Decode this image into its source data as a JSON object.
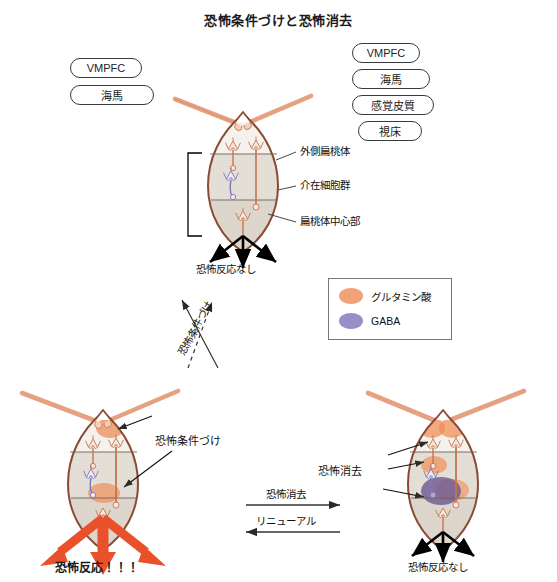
{
  "title": "恐怖条件づけと恐怖消去",
  "inputs": {
    "left_group": [
      {
        "label": "VMPFC"
      },
      {
        "label": "海馬"
      }
    ],
    "right_group": [
      {
        "label": "VMPFC"
      },
      {
        "label": "海馬"
      },
      {
        "label": "感覚皮質"
      },
      {
        "label": "視床"
      }
    ]
  },
  "panels": {
    "top": {
      "name": "naive-amygdala",
      "region_labels": [
        {
          "label": "外側扁桃体"
        },
        {
          "label": "介在細胞群"
        },
        {
          "label": "扁桃体中心部"
        }
      ],
      "output_caption": "恐怖反応なし"
    },
    "bottom_left": {
      "name": "conditioned-amygdala",
      "annotation": "恐怖条件づけ",
      "output_caption": "恐怖反応！！！"
    },
    "bottom_right": {
      "name": "extinguished-amygdala",
      "annotation": "恐怖消去",
      "output_caption": "恐怖反応なし"
    }
  },
  "transitions": {
    "vertical": {
      "forward_label": "恐怖条件づけ"
    },
    "horizontal": {
      "forward_label": "恐怖消去",
      "backward_label": "リニューアル"
    }
  },
  "legend": {
    "items": [
      {
        "label": "グルタミン酸",
        "color": "#f2a278",
        "shape": "ellipse"
      },
      {
        "label": "GABA",
        "color": "#9b8ec8",
        "shape": "ellipse"
      }
    ]
  },
  "colors": {
    "outline": "#8a4a33",
    "axon": "#e5a181",
    "glutamate": "#f2a278",
    "gaba": "#9b8ec8",
    "fear_arrow": "#e8512a",
    "no_fear_arrow": "#000000",
    "band_top": "#f4efe9",
    "band_mid": "#e3ded5",
    "band_bot": "#ded7cd"
  }
}
